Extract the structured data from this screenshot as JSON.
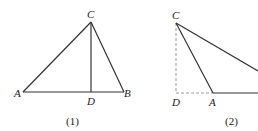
{
  "figure1": {
    "points": {
      "A": "A",
      "B": "B",
      "C": "C",
      "D": "D"
    },
    "caption": "(1)"
  },
  "figure2": {
    "points": {
      "C": "C",
      "D": "D",
      "A": "A"
    },
    "caption": "(2)"
  },
  "colors": {
    "line": "#333333",
    "dashed": "#999999"
  }
}
